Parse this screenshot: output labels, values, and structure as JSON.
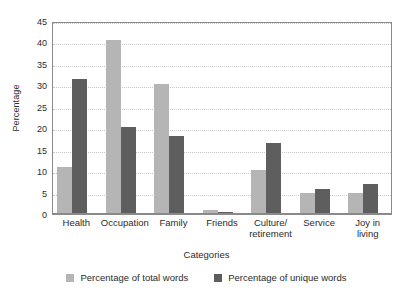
{
  "chart_data": {
    "type": "bar",
    "title": "",
    "xlabel": "Categories",
    "ylabel": "Percentage",
    "ylim": [
      0,
      45
    ],
    "yticks": [
      0,
      5,
      10,
      15,
      20,
      25,
      30,
      35,
      40,
      45
    ],
    "grid": true,
    "legend_position": "bottom",
    "categories": [
      "Health",
      "Occupation",
      "Family",
      "Friends",
      "Culture/\nretirement",
      "Service",
      "Joy in\nliving"
    ],
    "series": [
      {
        "name": "Percentage of total words",
        "color": "#b5b5b5",
        "values": [
          11,
          40.5,
          30.3,
          1,
          10.2,
          4.8,
          4.8
        ]
      },
      {
        "name": "Percentage of unique words",
        "color": "#5e5e5e",
        "values": [
          31.5,
          20.3,
          18.2,
          0.5,
          16.6,
          5.8,
          7
        ]
      }
    ]
  },
  "colors": {
    "series_total": "#b5b5b5",
    "series_unique": "#5e5e5e",
    "frame": "#8a8a8a",
    "gridline": "#c8c8c8",
    "text": "#2b2b2b",
    "background": "#ffffff"
  }
}
